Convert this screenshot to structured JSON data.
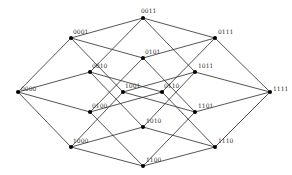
{
  "diagram": {
    "type": "4-dimensional hypercube graph (Q4)",
    "nodes": [
      {
        "id": "0000",
        "label": "0000",
        "x": 18,
        "y": 92,
        "lx": 3,
        "ly": -1
      },
      {
        "id": "0001",
        "label": "0001",
        "x": 71,
        "y": 38,
        "lx": 2,
        "ly": -4
      },
      {
        "id": "0010",
        "label": "0010",
        "x": 90,
        "y": 72,
        "lx": 2,
        "ly": -4
      },
      {
        "id": "0011",
        "label": "0011",
        "x": 143,
        "y": 18,
        "lx": -2,
        "ly": -5
      },
      {
        "id": "0100",
        "label": "0100",
        "x": 90,
        "y": 112,
        "lx": 2,
        "ly": -4
      },
      {
        "id": "0101",
        "label": "0101",
        "x": 143,
        "y": 58,
        "lx": 2,
        "ly": -4
      },
      {
        "id": "0110",
        "label": "0110",
        "x": 162,
        "y": 92,
        "lx": 2,
        "ly": -4
      },
      {
        "id": "0111",
        "label": "0111",
        "x": 215,
        "y": 38,
        "lx": 3,
        "ly": -4
      },
      {
        "id": "1000",
        "label": "1000",
        "x": 71,
        "y": 147,
        "lx": 2,
        "ly": -4
      },
      {
        "id": "1001",
        "label": "1001",
        "x": 123,
        "y": 92,
        "lx": 2,
        "ly": -4
      },
      {
        "id": "1010",
        "label": "1010",
        "x": 143,
        "y": 127,
        "lx": 3,
        "ly": -4
      },
      {
        "id": "1011",
        "label": "1011",
        "x": 195,
        "y": 72,
        "lx": 3,
        "ly": -4
      },
      {
        "id": "1100",
        "label": "1100",
        "x": 143,
        "y": 166,
        "lx": 3,
        "ly": -4
      },
      {
        "id": "1101",
        "label": "1101",
        "x": 195,
        "y": 112,
        "lx": 3,
        "ly": -4
      },
      {
        "id": "1110",
        "label": "1110",
        "x": 215,
        "y": 147,
        "lx": 3,
        "ly": -4
      },
      {
        "id": "1111",
        "label": "1111",
        "x": 270,
        "y": 92,
        "lx": 3,
        "ly": -1
      }
    ],
    "edges": [
      [
        "0000",
        "0001"
      ],
      [
        "0000",
        "0010"
      ],
      [
        "0000",
        "0100"
      ],
      [
        "0000",
        "1000"
      ],
      [
        "0001",
        "0011"
      ],
      [
        "0001",
        "0101"
      ],
      [
        "0001",
        "1001"
      ],
      [
        "0010",
        "0011"
      ],
      [
        "0010",
        "0110"
      ],
      [
        "0010",
        "1010"
      ],
      [
        "0011",
        "0111"
      ],
      [
        "0011",
        "1011"
      ],
      [
        "0100",
        "0101"
      ],
      [
        "0100",
        "0110"
      ],
      [
        "0100",
        "1100"
      ],
      [
        "0101",
        "0111"
      ],
      [
        "0101",
        "1101"
      ],
      [
        "0110",
        "0111"
      ],
      [
        "0110",
        "1110"
      ],
      [
        "0111",
        "1111"
      ],
      [
        "1000",
        "1001"
      ],
      [
        "1000",
        "1010"
      ],
      [
        "1000",
        "1100"
      ],
      [
        "1001",
        "1011"
      ],
      [
        "1001",
        "1101"
      ],
      [
        "1010",
        "1011"
      ],
      [
        "1010",
        "1110"
      ],
      [
        "1011",
        "1111"
      ],
      [
        "1100",
        "1101"
      ],
      [
        "1100",
        "1110"
      ],
      [
        "1101",
        "1111"
      ],
      [
        "1110",
        "1111"
      ]
    ]
  }
}
